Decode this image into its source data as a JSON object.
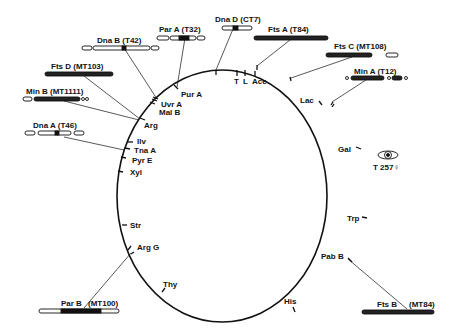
{
  "diagram": {
    "type": "circular genetic map",
    "markers": [
      {
        "name": "T",
        "label": "T"
      },
      {
        "name": "L",
        "label": "L"
      },
      {
        "name": "Ace",
        "label": "Ace"
      },
      {
        "name": "Lac",
        "label": "Lac"
      },
      {
        "name": "Gal",
        "label": "Gal"
      },
      {
        "name": "Trp",
        "label": "Trp"
      },
      {
        "name": "PabB",
        "label": "Pab B"
      },
      {
        "name": "His",
        "label": "His"
      },
      {
        "name": "Thy",
        "label": "Thy"
      },
      {
        "name": "ArgG",
        "label": "Arg G"
      },
      {
        "name": "Str",
        "label": "Str"
      },
      {
        "name": "Xyl",
        "label": "Xyl"
      },
      {
        "name": "PyrE",
        "label": "Pyr E"
      },
      {
        "name": "TnaA",
        "label": "Tna A"
      },
      {
        "name": "Ilv",
        "label": "Ilv"
      },
      {
        "name": "Arg",
        "label": "Arg"
      },
      {
        "name": "MalB",
        "label": "Mal B"
      },
      {
        "name": "UvrA",
        "label": "Uvr A"
      },
      {
        "name": "PurA",
        "label": "Pur A"
      }
    ],
    "mutants": [
      {
        "label": "Dna D (CT7)"
      },
      {
        "label": "Fts A (T84)"
      },
      {
        "label": "Fts C (MT108)"
      },
      {
        "label": "Min A (T12)"
      },
      {
        "label": "Par A (T32)"
      },
      {
        "label": "Dna B (T42)"
      },
      {
        "label": "Fts D (MT103)"
      },
      {
        "label": "Min B (MT1111)"
      },
      {
        "label": "Dna A (T46)"
      },
      {
        "label": "Par B"
      },
      {
        "label": "(MT100)"
      },
      {
        "label": "Fts B"
      },
      {
        "label": "(MT84)"
      }
    ],
    "cell_label": "T 257♀"
  }
}
